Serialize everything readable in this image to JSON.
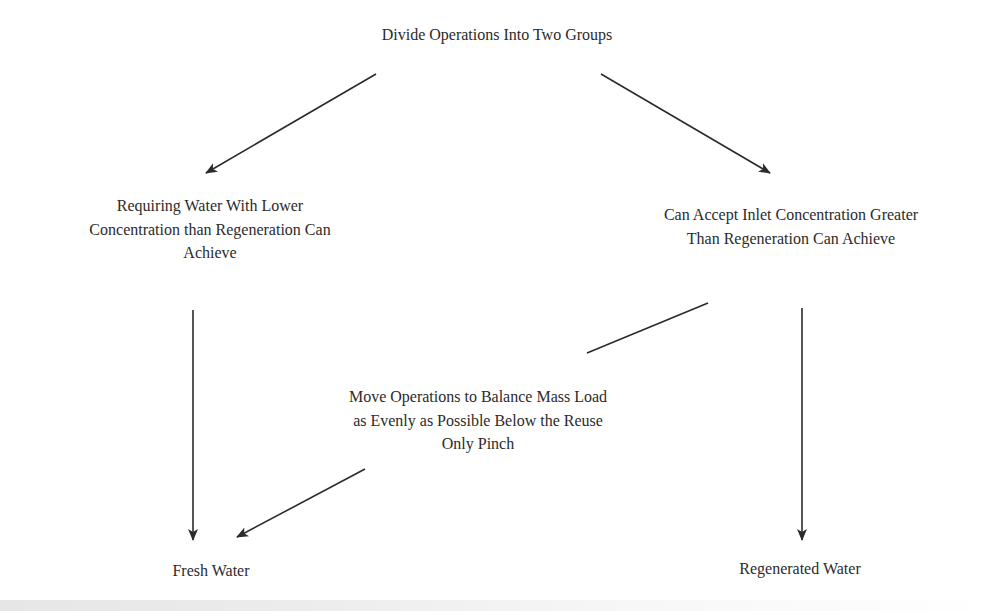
{
  "diagram": {
    "type": "flowchart",
    "nodes": {
      "root": {
        "lines": [
          "Divide Operations Into Two Groups"
        ]
      },
      "left_group": {
        "lines": [
          "Requiring Water With Lower",
          "Concentration than Regeneration Can",
          "Achieve"
        ]
      },
      "right_group": {
        "lines": [
          "Can Accept Inlet Concentration Greater",
          "Than Regeneration Can Achieve"
        ]
      },
      "balance": {
        "lines": [
          "Move Operations to Balance Mass Load",
          "as Evenly as Possible Below the Reuse",
          "Only Pinch"
        ]
      },
      "fresh_water": {
        "lines": [
          "Fresh Water"
        ]
      },
      "regenerated_water": {
        "lines": [
          "Regenerated Water"
        ]
      }
    },
    "edges": [
      {
        "from": "root",
        "to": "left_group",
        "arrow": true
      },
      {
        "from": "root",
        "to": "right_group",
        "arrow": true
      },
      {
        "from": "left_group",
        "to": "fresh_water",
        "arrow": true
      },
      {
        "from": "right_group",
        "to": "regenerated_water",
        "arrow": true
      },
      {
        "from": "right_group",
        "to": "balance",
        "arrow": false
      },
      {
        "from": "balance",
        "to": "fresh_water",
        "arrow": true
      }
    ],
    "colors": {
      "line": "#2b2b2b",
      "text": "#2b2b2b",
      "background": "#ffffff"
    }
  }
}
